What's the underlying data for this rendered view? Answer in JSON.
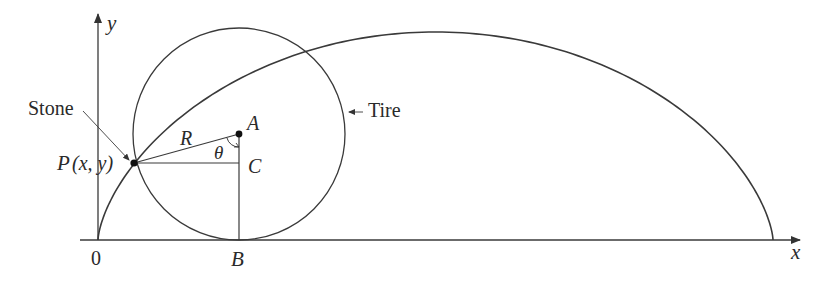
{
  "figure": {
    "type": "cycloid-diagram",
    "colors": {
      "stroke": "#3a3a3a",
      "text": "#2a2a2a",
      "background": "#ffffff"
    }
  },
  "axes": {
    "x_label": "x",
    "y_label": "y",
    "origin_label": "0"
  },
  "labels": {
    "stone": "Stone",
    "tire": "Tire",
    "point_p": "P",
    "point_p_coords": "(x, y)",
    "point_a": "A",
    "point_b": "B",
    "point_c": "C",
    "radius": "R",
    "angle": "θ"
  },
  "geometry": {
    "origin_px": [
      98,
      240
    ],
    "cycloid_end_x_px": 773,
    "cycloid_peak_y_px": 32,
    "tire_center_A_px": [
      239,
      134
    ],
    "tire_radius_px": 106,
    "point_P_px": [
      134,
      163
    ],
    "point_C_px": [
      239,
      163
    ],
    "point_B_px": [
      239,
      240
    ]
  }
}
